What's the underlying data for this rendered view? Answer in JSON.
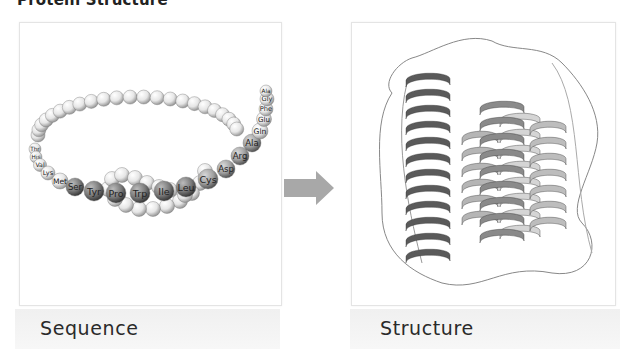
{
  "title": "Protein Structure",
  "left_panel": {
    "caption": "Sequence",
    "amino_acids": [
      "Thr",
      "His",
      "Val",
      "Lys",
      "Met",
      "Ser",
      "Tyr",
      "Pro",
      "Trp",
      "Ile",
      "Leu",
      "Cys",
      "Asp",
      "Arg",
      "Ala",
      "Gln",
      "Glu",
      "Phe",
      "Gly",
      "Ala"
    ]
  },
  "right_panel": {
    "caption": "Structure"
  },
  "arrow": {
    "icon": "right-arrow-icon",
    "color": "#a8a8a8"
  }
}
